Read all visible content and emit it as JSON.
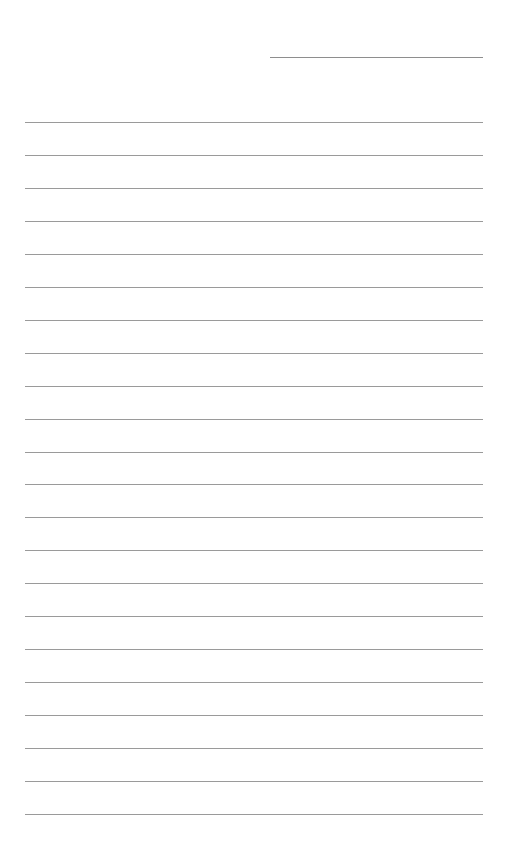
{
  "page": {
    "type": "lined-paper",
    "header_line": {
      "label": ""
    },
    "rule_count": 22,
    "rule_color": "#9a9a9a",
    "lines": [
      "",
      "",
      "",
      "",
      "",
      "",
      "",
      "",
      "",
      "",
      "",
      "",
      "",
      "",
      "",
      "",
      "",
      "",
      "",
      "",
      "",
      ""
    ]
  }
}
